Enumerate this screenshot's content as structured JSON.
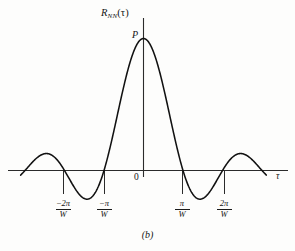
{
  "figure": {
    "caption": "(b)",
    "peak_label": "P",
    "origin_label": "0",
    "y_axis_title": {
      "base": "R",
      "subscript": "NN",
      "argument": "(τ)"
    },
    "x_axis_title": "τ"
  },
  "ticks": [
    {
      "numerator": "−2π",
      "denominator": "W",
      "label": "−2π/W",
      "x": -2
    },
    {
      "numerator": "−π",
      "denominator": "W",
      "label": "−π/W",
      "x": -1
    },
    {
      "numerator": "π",
      "denominator": "W",
      "label": "π/W",
      "x": 1
    },
    {
      "numerator": "2π",
      "denominator": "W",
      "label": "2π/W",
      "x": 2
    }
  ],
  "colors": {
    "curve": "#111111",
    "axis": "#333333",
    "background": "#fdfdfc",
    "text": "#141414"
  },
  "chart_data": {
    "type": "line",
    "title": "",
    "subtitle": "(b)",
    "xlabel": "τ",
    "ylabel": "R_NN(τ)",
    "function": "R_NN(τ) = P · sin(Wτ) / (Wτ)",
    "grid": false,
    "legend": null,
    "xlim": [
      -3.0,
      3.0
    ],
    "ylim": [
      -0.25,
      1.12
    ],
    "xtick_values": [
      -2,
      -1,
      0,
      1,
      2
    ],
    "xtick_labels": [
      "−2π/W",
      "−π/W",
      "0",
      "π/W",
      "2π/W"
    ],
    "ytick_values": [
      1
    ],
    "ytick_labels": [
      "P"
    ],
    "x_unit": "π/W",
    "annotations": [
      {
        "text": "P",
        "x": 0,
        "y": 1,
        "note": "peak amplitude at origin"
      },
      {
        "text": "0",
        "x": 0,
        "y": 0,
        "note": "origin"
      }
    ],
    "zero_crossings": [
      -3,
      -2,
      -1,
      1,
      2,
      3
    ],
    "series": [
      {
        "name": "R_NN(τ)",
        "x": [
          -3.0,
          -2.9,
          -2.8,
          -2.7,
          -2.6,
          -2.5,
          -2.4,
          -2.3,
          -2.2,
          -2.1,
          -2.0,
          -1.9,
          -1.8,
          -1.7,
          -1.6,
          -1.5,
          -1.4,
          -1.3,
          -1.2,
          -1.1,
          -1.0,
          -0.9,
          -0.8,
          -0.7,
          -0.6,
          -0.5,
          -0.4,
          -0.3,
          -0.2,
          -0.1,
          0.0,
          0.1,
          0.2,
          0.3,
          0.4,
          0.5,
          0.6,
          0.7,
          0.8,
          0.9,
          1.0,
          1.1,
          1.2,
          1.3,
          1.4,
          1.5,
          1.6,
          1.7,
          1.8,
          1.9,
          2.0,
          2.1,
          2.2,
          2.3,
          2.4,
          2.5,
          2.6,
          2.7,
          2.8,
          2.9,
          3.0
        ],
        "y": [
          0.0,
          0.0328,
          0.062,
          0.0842,
          0.0969,
          0.0984,
          0.0883,
          0.0674,
          0.0377,
          0.0021,
          -0.0,
          -0.0507,
          -0.0927,
          -0.1224,
          -0.1374,
          -0.1366,
          -0.1202,
          -0.0898,
          -0.0485,
          -0.0,
          -0.0,
          0.1073,
          0.2339,
          0.3678,
          0.5046,
          0.6366,
          0.7568,
          0.8584,
          0.9355,
          0.9836,
          1.0,
          0.9836,
          0.9355,
          0.8584,
          0.7568,
          0.6366,
          0.5046,
          0.3678,
          0.2339,
          0.1073,
          0.0,
          -0.0485,
          -0.0898,
          -0.1202,
          -0.1366,
          -0.1374,
          -0.1224,
          -0.0927,
          -0.0507,
          -0.0,
          0.0,
          0.0377,
          0.0674,
          0.0883,
          0.0984,
          0.0969,
          0.0842,
          0.062,
          0.0328,
          0.0,
          0.0
        ]
      }
    ]
  }
}
